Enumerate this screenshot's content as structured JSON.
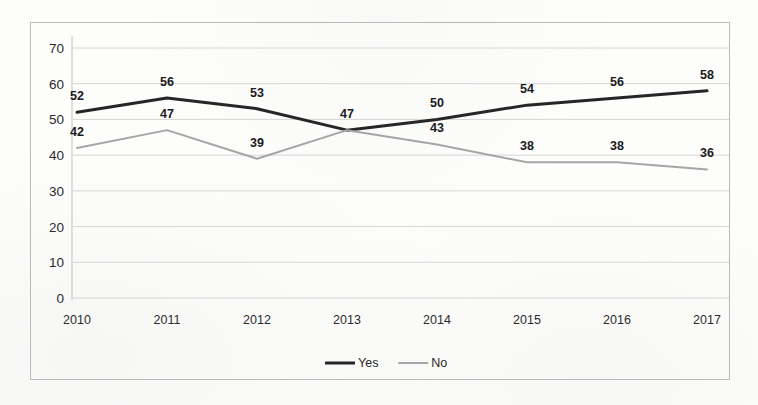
{
  "chart_data": {
    "type": "line",
    "title": "",
    "subtitle": "",
    "xlabel": "",
    "ylabel": "",
    "categories": [
      "2010",
      "2011",
      "2012",
      "2013",
      "2014",
      "2015",
      "2016",
      "2017"
    ],
    "series": [
      {
        "name": "Yes",
        "color": "#262626",
        "line_width": 3,
        "values": [
          52,
          56,
          53,
          47,
          50,
          54,
          56,
          58
        ]
      },
      {
        "name": "No",
        "color": "#a6a6a6",
        "line_width": 2,
        "values": [
          42,
          47,
          39,
          47,
          43,
          38,
          38,
          36
        ]
      }
    ],
    "ylim": [
      0,
      70
    ],
    "yticks": [
      "0",
      "10",
      "20",
      "30",
      "40",
      "50",
      "60",
      "70"
    ],
    "ytick_values": [
      0,
      10,
      20,
      30,
      40,
      50,
      60,
      70
    ],
    "grid": true,
    "grid_axis": "y",
    "legend_position": "bottom",
    "data_labels": true,
    "shared_label_2013": "47",
    "markers": false
  },
  "legend": {
    "items": [
      {
        "label": "Yes",
        "color": "#262626",
        "width": 3
      },
      {
        "label": "No",
        "color": "#a6a6a6",
        "width": 2
      }
    ]
  },
  "frame": {
    "border_color": "#b9b9b9",
    "background": "#fdfdfc"
  }
}
